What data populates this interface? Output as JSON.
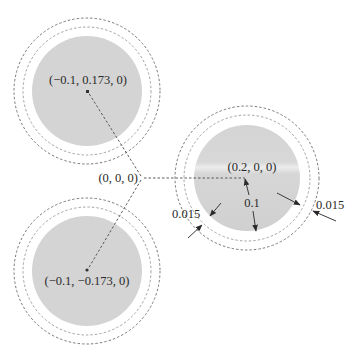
{
  "diagram": {
    "origin": {
      "label": "(0, 0, 0)",
      "x": 141,
      "y": 178
    },
    "spheres": [
      {
        "id": "top",
        "label": "(−0.1, 0.173, 0)",
        "cx": 87,
        "cy": 91,
        "label_x": 88,
        "label_y": 84,
        "r_core": 55,
        "r_inner": 64,
        "r_outer": 73
      },
      {
        "id": "right",
        "label": "(0.2, 0, 0)",
        "cx": 247,
        "cy": 178,
        "label_x": 252,
        "label_y": 171,
        "r_core": 53,
        "r_inner": 63,
        "r_outer": 73
      },
      {
        "id": "bottom",
        "label": "(−0.1, −0.173, 0)",
        "cx": 87,
        "cy": 271,
        "label_x": 87,
        "label_y": 285,
        "r_core": 55,
        "r_inner": 64,
        "r_outer": 73
      }
    ],
    "dimensions": {
      "radius_label": "0.1",
      "shell_label_left": "0.015",
      "shell_label_right": "0.015"
    },
    "colors": {
      "core_fill": "#d4d4d4",
      "ring_stroke": "#7a7a7a",
      "text": "#2a2a2a",
      "background": "#ffffff"
    }
  }
}
